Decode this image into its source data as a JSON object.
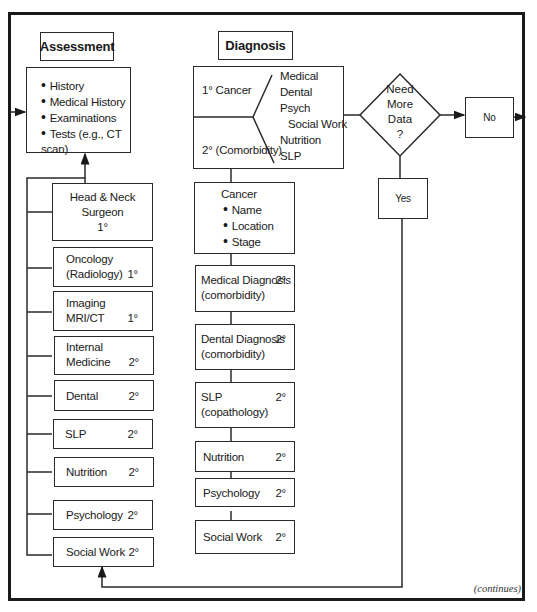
{
  "assessment": {
    "header": "Assessment",
    "items": [
      "History",
      "Medical History",
      "Examinations",
      "Tests (e.g., CT scan)"
    ],
    "providers": [
      {
        "lines": [
          "Head & Neck",
          "Surgeon",
          "1°"
        ],
        "level": ""
      },
      {
        "lines": [
          "Oncology",
          "(Radiology)"
        ],
        "level": "1°"
      },
      {
        "lines": [
          "Imaging",
          "MRI/CT"
        ],
        "level": "1°"
      },
      {
        "lines": [
          "Internal",
          "Medicine"
        ],
        "level": "2°"
      },
      {
        "lines": [
          "Dental"
        ],
        "level": "2°"
      },
      {
        "lines": [
          "SLP"
        ],
        "level": "2°"
      },
      {
        "lines": [
          "Nutrition"
        ],
        "level": "2°"
      },
      {
        "lines": [
          "Psychology"
        ],
        "level": "2°"
      },
      {
        "lines": [
          "Social Work"
        ],
        "level": "2°"
      }
    ]
  },
  "diagnosis": {
    "header": "Diagnosis",
    "primary": "1° Cancer",
    "secondary": "2° (Comorbidity)",
    "branches": [
      "Medical",
      "Dental",
      "Psych",
      "Social Work",
      "Nutrition",
      "SLP"
    ],
    "cancer_box": {
      "title": "Cancer",
      "items": [
        "Name",
        "Location",
        "Stage"
      ]
    },
    "steps": [
      {
        "lines": [
          "Medical Diagnosis",
          "(comorbidity)"
        ],
        "level": "2°"
      },
      {
        "lines": [
          "Dental Diagnosis",
          "(comorbidity)"
        ],
        "level": "2°"
      },
      {
        "lines": [
          "SLP",
          "(copathology)"
        ],
        "level": "2°"
      },
      {
        "lines": [
          "Nutrition"
        ],
        "level": "2°"
      },
      {
        "lines": [
          "Psychology"
        ],
        "level": "2°"
      },
      {
        "lines": [
          "Social Work"
        ],
        "level": "2°"
      }
    ]
  },
  "decision": {
    "question_lines": [
      "Need",
      "More",
      "Data",
      "?"
    ],
    "no_label": "No",
    "yes_label": "Yes"
  },
  "footer": {
    "continues": "(continues)"
  }
}
